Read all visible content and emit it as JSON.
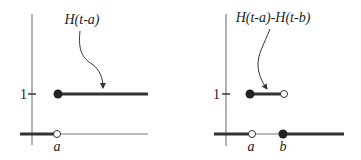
{
  "colors": {
    "ink": "#333333",
    "axis": "#555555",
    "background": "#ffffff"
  },
  "left_plot": {
    "function_label": "H(t-a)",
    "y_tick_label": "1",
    "x_tick_labels": [
      "a"
    ],
    "description": "Unit step shifted to a: 0 for t<a (open circle at t=a on axis), 1 for t>=a (filled circle at t=a)"
  },
  "right_plot": {
    "function_label": "H(t-a)-H(t-b)",
    "y_tick_label": "1",
    "x_tick_labels": [
      "a",
      "b"
    ],
    "description": "Rectangular pulse: 1 on [a,b) (filled at a, open at b), 0 elsewhere (open at a, filled at b on axis)"
  }
}
